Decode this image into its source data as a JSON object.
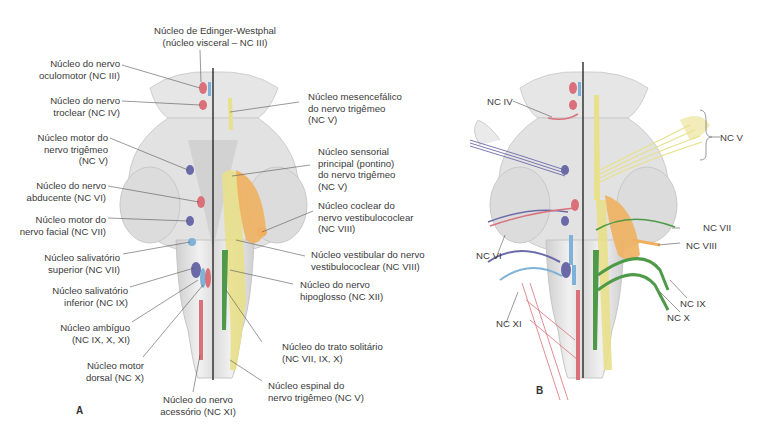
{
  "figure": {
    "panels": [
      {
        "id": "A",
        "letter": "A",
        "labels": {
          "edinger": "Núcleo de Edinger-Westphal\n(núcleo visceral – NC III)",
          "oculomotor": "Núcleo do nervo\noculomotor (NC III)",
          "troclear": "Núcleo do nervo\ntroclear (NC IV)",
          "motor_trigemeo": "Núcleo motor do\nnervo trigêmeo\n(NC V)",
          "abducente": "Núcleo do nervo\nabducente (NC VI)",
          "motor_facial": "Núcleo motor do\nnervo facial (NC VII)",
          "salivatorio_sup": "Núcleo salivatório\nsuperior (NC VII)",
          "salivatorio_inf": "Núcleo salivatório\ninferior (NC IX)",
          "ambiguo": "Núcleo ambíguo\n(NC IX, X, XI)",
          "motor_dorsal": "Núcleo motor\ndorsal (NC X)",
          "acessorio": "Núcleo do nervo\nacessório (NC XI)",
          "mesencefalico": "Núcleo mesencefálico\ndo nervo trigêmeo\n(NC V)",
          "sensorial_principal": "Núcleo sensorial\nprincipal (pontino)\ndo nervo trigêmeo\n(NC V)",
          "coclear": "Núcleo coclear do\nnervo vestibulococlear\n(NC VIII)",
          "vestibular": "Núcleo vestibular do nervo\nvestibulococlear (NC VIII)",
          "hipoglosso": "Núcleo do nervo\nhipoglosso (NC XII)",
          "trato_solitario": "Núcleo do trato solitário\n(NC VII, IX, X)",
          "espinal_trigemeo": "Núcleo espinal do\nnervo trigêmeo (NC V)"
        }
      },
      {
        "id": "B",
        "letter": "B",
        "labels": {
          "nc_iv": "NC IV",
          "nc_v": "NC V",
          "nc_vi": "NC VI",
          "nc_vii": "NC VII",
          "nc_viii": "NC VIII",
          "nc_ix": "NC IX",
          "nc_x": "NC X",
          "nc_xi": "NC XI"
        }
      }
    ],
    "colors": {
      "motor_somatic": "#d9707a",
      "motor_branchial": "#6b6aa8",
      "visceral_motor": "#7fb2d8",
      "sensory_trigeminal": "#e8e08a",
      "cochlear_vestibular": "#f0b060",
      "solitary": "#4e9a48",
      "brainstem": "#e4e4e4",
      "midline": "#1a1a1a"
    }
  }
}
